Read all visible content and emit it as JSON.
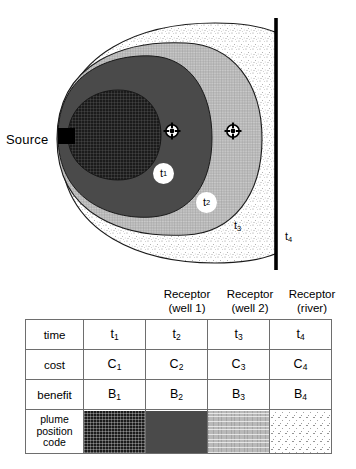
{
  "diagram": {
    "source_label": "Source",
    "source_marker": "black-square",
    "river_label": "river-boundary-line",
    "receptors": [
      {
        "name": "receptor-well-1",
        "symbol": "crosshair-target-icon",
        "x": 172,
        "y": 131
      },
      {
        "name": "receptor-well-2",
        "symbol": "crosshair-target-icon",
        "x": 233,
        "y": 131
      }
    ],
    "plume_labels": [
      {
        "id": "t1",
        "text": "t",
        "sub": "1",
        "style": "white-circle-badge"
      },
      {
        "id": "t2",
        "text": "t",
        "sub": "2",
        "style": "white-circle-badge"
      },
      {
        "id": "t3",
        "text": "t",
        "sub": "3",
        "style": "plain"
      },
      {
        "id": "t4",
        "text": "t",
        "sub": "4",
        "style": "plain"
      }
    ],
    "plume_zones": [
      {
        "id": "zone-source",
        "pattern": "dark-crosshatch",
        "color": "#1b1b1b"
      },
      {
        "id": "zone-t1",
        "pattern": "solid-dark-gray",
        "color": "#4a4a4a"
      },
      {
        "id": "zone-t2",
        "pattern": "light-crosshatch",
        "color": "#b9b9b9"
      },
      {
        "id": "zone-t3",
        "pattern": "white-stipple",
        "color": "#ffffff"
      }
    ]
  },
  "table": {
    "column_headers": [
      {
        "line1": "Receptor",
        "line2": "(well 1)"
      },
      {
        "line1": "Receptor",
        "line2": "(well 2)"
      },
      {
        "line1": "Receptor",
        "line2": "(river)"
      }
    ],
    "rows": [
      {
        "label": "time",
        "cells": [
          {
            "text": "t",
            "sub": "1"
          },
          {
            "text": "t",
            "sub": "2"
          },
          {
            "text": "t",
            "sub": "3"
          },
          {
            "text": "t",
            "sub": "4"
          }
        ]
      },
      {
        "label": "cost",
        "cells": [
          {
            "text": "C",
            "sub": "1"
          },
          {
            "text": "C",
            "sub": "2"
          },
          {
            "text": "C",
            "sub": "3"
          },
          {
            "text": "C",
            "sub": "4"
          }
        ]
      },
      {
        "label": "benefit",
        "cells": [
          {
            "text": "B",
            "sub": "1"
          },
          {
            "text": "B",
            "sub": "2"
          },
          {
            "text": "B",
            "sub": "3"
          },
          {
            "text": "B",
            "sub": "4"
          }
        ]
      }
    ],
    "swatch_row": {
      "label_lines": [
        "plume",
        "position",
        "code"
      ],
      "swatches": [
        {
          "pattern": "dark-crosshatch",
          "color": "#1b1b1b"
        },
        {
          "pattern": "solid-dark-gray",
          "color": "#4a4a4a"
        },
        {
          "pattern": "light-crosshatch",
          "color": "#b9b9b9"
        },
        {
          "pattern": "white-stipple",
          "color": "#ffffff"
        }
      ]
    }
  }
}
